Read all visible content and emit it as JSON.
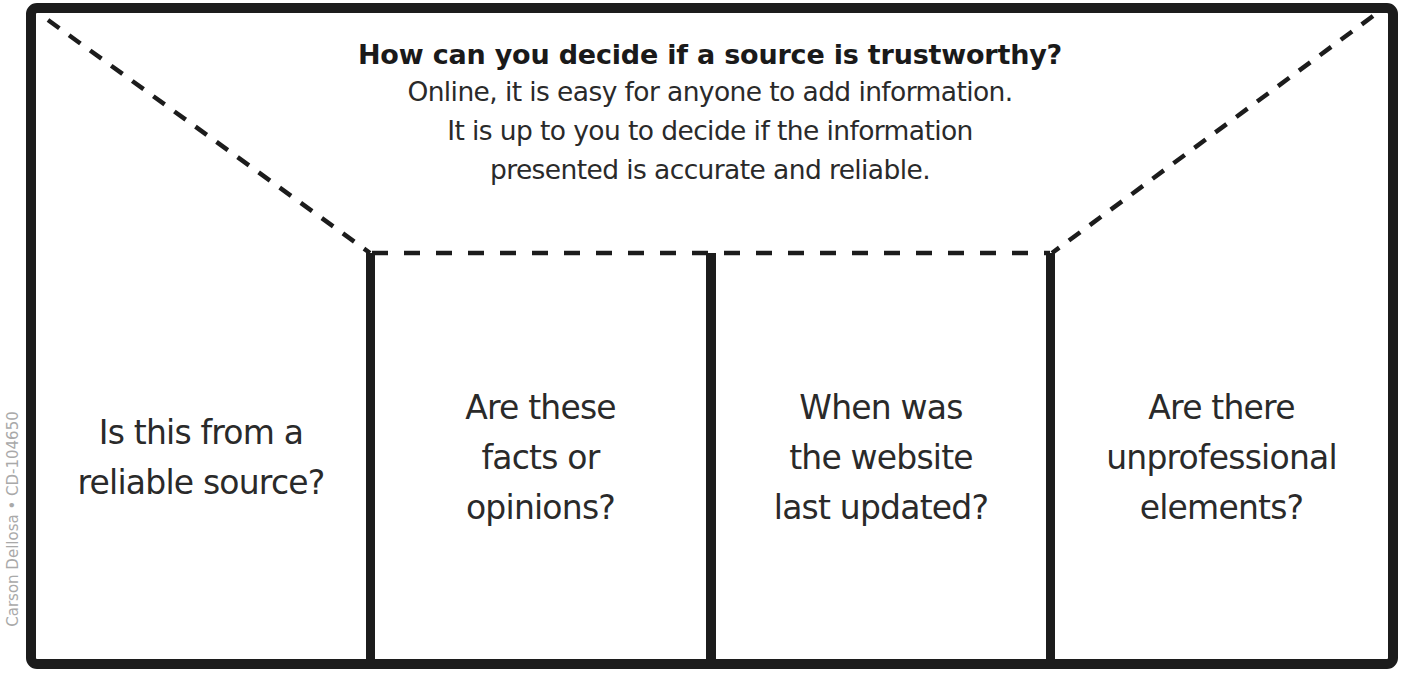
{
  "header": {
    "title": "How can you decide if a source is trustworthy?",
    "body_lines": [
      "Online, it is easy for anyone to add information.",
      "It is up to you to decide if the information",
      "presented is accurate and reliable."
    ]
  },
  "columns": [
    {
      "lines": [
        "Is this from a",
        "reliable source?"
      ]
    },
    {
      "lines": [
        "Are these",
        "facts or",
        "opinions?"
      ]
    },
    {
      "lines": [
        "When was",
        "the website",
        "last updated?"
      ]
    },
    {
      "lines": [
        "Are there",
        "unprofessional",
        "elements?"
      ]
    }
  ],
  "credit": "Carson Dellosa • CD-104650",
  "colors": {
    "border": "#1c1c1c",
    "text": "#2a2a2a",
    "credit": "#a9a9a9",
    "background": "#ffffff"
  }
}
